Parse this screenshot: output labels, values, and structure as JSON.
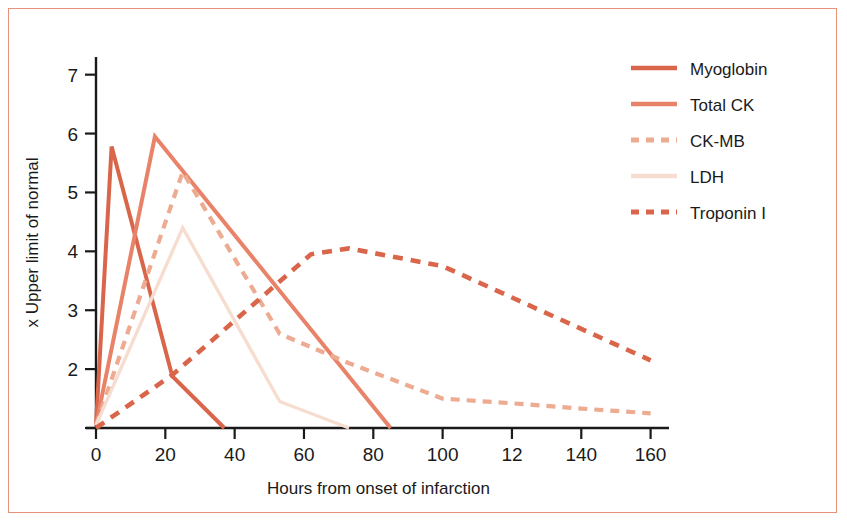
{
  "figure": {
    "border_color": "#e8927c",
    "background": "#ffffff"
  },
  "chart_data": {
    "type": "line",
    "title": "",
    "xlabel": "Hours from onset of infarction",
    "ylabel": "x Upper limit of normal",
    "xlim": [
      0,
      163
    ],
    "ylim": [
      1.0,
      7.3
    ],
    "grid": false,
    "legend_position": "top-right",
    "xticks": [
      0,
      20,
      40,
      60,
      80,
      100,
      120,
      140,
      160
    ],
    "xtick_labels": [
      "0",
      "20",
      "40",
      "60",
      "80",
      "100",
      "12",
      "140",
      "160"
    ],
    "yticks": [
      2,
      3,
      4,
      5,
      6,
      7
    ],
    "ytick_labels": [
      "2",
      "3",
      "4",
      "5",
      "6",
      "7"
    ],
    "series": [
      {
        "name": "Myoglobin",
        "color": "#d9664a",
        "style": "solid",
        "width": 4.0,
        "x": [
          0,
          4.5,
          22,
          37
        ],
        "y": [
          1.05,
          5.78,
          1.88,
          1.0
        ]
      },
      {
        "name": "Total CK",
        "color": "#e8836a",
        "style": "solid",
        "width": 4.0,
        "x": [
          0,
          17,
          85
        ],
        "y": [
          1.05,
          5.95,
          1.0
        ]
      },
      {
        "name": "CK-MB",
        "color": "#edab92",
        "style": "dashed",
        "width": 4.2,
        "dash": "9,7",
        "x": [
          0,
          25,
          53,
          73,
          100,
          120,
          140,
          160
        ],
        "y": [
          1.05,
          5.35,
          2.6,
          2.1,
          1.5,
          1.42,
          1.33,
          1.25
        ]
      },
      {
        "name": "LDH",
        "color": "#f6ddd0",
        "style": "solid",
        "width": 3.4,
        "x": [
          0,
          25,
          53,
          73
        ],
        "y": [
          1.05,
          4.4,
          1.45,
          1.0
        ]
      },
      {
        "name": "Troponin I",
        "color": "#d9664a",
        "style": "dashed",
        "width": 4.6,
        "dash": "10,8",
        "x": [
          0,
          22,
          62,
          73,
          100,
          160
        ],
        "y": [
          1.0,
          1.9,
          3.95,
          4.05,
          3.75,
          2.15
        ]
      }
    ]
  },
  "legend": {
    "items": [
      {
        "label": "Myoglobin",
        "color": "#d9664a",
        "style": "solid"
      },
      {
        "label": "Total CK",
        "color": "#e8836a",
        "style": "solid"
      },
      {
        "label": "CK-MB",
        "color": "#edab92",
        "style": "dashed"
      },
      {
        "label": "LDH",
        "color": "#f6ddd0",
        "style": "solid"
      },
      {
        "label": "Troponin I",
        "color": "#d9664a",
        "style": "dashed"
      }
    ]
  }
}
